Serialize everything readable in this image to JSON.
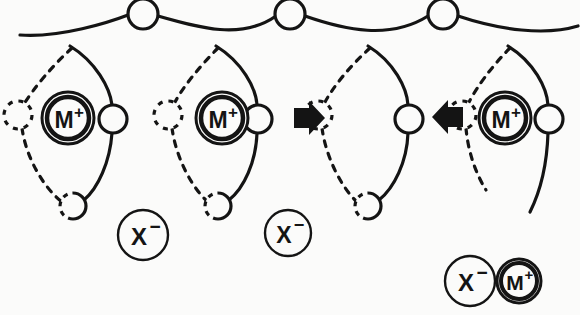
{
  "figure": {
    "background_color": "#fbfbfa",
    "ink_color": "#141414",
    "width": 580,
    "height": 315
  },
  "labels": {
    "cation": "M",
    "cation_charge": "+",
    "anion": "X",
    "anion_charge": "−"
  },
  "cations": [
    {
      "name": "cation-site-1",
      "label": "M",
      "charge": "+",
      "cx": 68,
      "cy": 118,
      "r": 26
    },
    {
      "name": "cation-site-2",
      "label": "M",
      "charge": "+",
      "cx": 222,
      "cy": 118,
      "r": 26
    },
    {
      "name": "cation-site-3",
      "label": "M",
      "charge": "+",
      "cx": 505,
      "cy": 118,
      "r": 26
    }
  ],
  "vacant_sites": [
    {
      "name": "vacant-site-1",
      "cx": 330,
      "cy": 118,
      "r": 21
    }
  ],
  "free_anions": [
    {
      "name": "anion-free-1",
      "label": "X",
      "charge": "−",
      "cx": 143,
      "cy": 235,
      "r": 25
    },
    {
      "name": "anion-free-2",
      "label": "X",
      "charge": "−",
      "cx": 288,
      "cy": 233,
      "r": 23
    }
  ],
  "ion_pair": {
    "name": "ion-pair",
    "anion": {
      "label": "X",
      "charge": "−",
      "cx": 470,
      "cy": 281,
      "r": 25
    },
    "cation": {
      "label": "M",
      "charge": "+",
      "cx": 519,
      "cy": 281,
      "r": 22
    }
  },
  "chain_nodes": [
    {
      "name": "chain-node-top-1",
      "cx": 143,
      "cy": 14,
      "r": 15,
      "style": "solid"
    },
    {
      "name": "chain-node-top-2",
      "cx": 290,
      "cy": 14,
      "r": 15,
      "style": "solid"
    },
    {
      "name": "chain-node-top-3",
      "cx": 443,
      "cy": 14,
      "r": 15,
      "style": "solid"
    },
    {
      "name": "chain-node-right-1",
      "cx": 113,
      "cy": 119,
      "r": 14,
      "style": "solid"
    },
    {
      "name": "chain-node-right-2",
      "cx": 258,
      "cy": 119,
      "r": 14,
      "style": "solid"
    },
    {
      "name": "chain-node-right-3",
      "cx": 409,
      "cy": 119,
      "r": 14,
      "style": "solid"
    },
    {
      "name": "chain-node-right-4",
      "cx": 549,
      "cy": 119,
      "r": 14,
      "style": "solid"
    },
    {
      "name": "chain-node-bottom-1",
      "cx": 73,
      "cy": 206,
      "r": 13,
      "style": "half-dashed"
    },
    {
      "name": "chain-node-bottom-2",
      "cx": 218,
      "cy": 206,
      "r": 13,
      "style": "half-dashed"
    },
    {
      "name": "chain-node-bottom-3",
      "cx": 368,
      "cy": 206,
      "r": 13,
      "style": "half-dashed"
    },
    {
      "name": "ghost-node-1",
      "cx": 18,
      "cy": 115,
      "r": 14,
      "style": "dashed"
    },
    {
      "name": "ghost-node-2",
      "cx": 168,
      "cy": 115,
      "r": 14,
      "style": "dashed"
    },
    {
      "name": "ghost-node-3",
      "cx": 318,
      "cy": 115,
      "r": 14,
      "style": "dashed"
    },
    {
      "name": "ghost-node-4",
      "cx": 462,
      "cy": 115,
      "r": 14,
      "style": "dashed"
    }
  ],
  "arrows": [
    {
      "name": "hop-arrow-right",
      "direction": "right",
      "x": 296,
      "y": 118
    },
    {
      "name": "hop-arrow-left",
      "direction": "left",
      "x": 447,
      "y": 117
    }
  ]
}
